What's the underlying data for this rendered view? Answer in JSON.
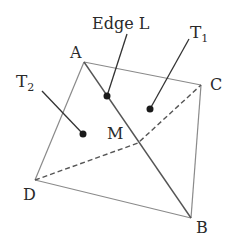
{
  "diagram": {
    "vertices": {
      "A": {
        "label": "A",
        "x": 84,
        "y": 62
      },
      "B": {
        "label": "B",
        "x": 191,
        "y": 218
      },
      "C": {
        "label": "C",
        "x": 201,
        "y": 85
      },
      "D": {
        "label": "D",
        "x": 35,
        "y": 180
      },
      "M": {
        "label": "M",
        "x": 138,
        "y": 143
      }
    },
    "annotations": {
      "edge_l": {
        "label": "Edge L"
      },
      "t1": {
        "label": "T",
        "sub": "1"
      },
      "t2": {
        "label": "T",
        "sub": "2"
      }
    },
    "colors": {
      "edge": "#8a8a8a",
      "diag": "#555555",
      "dashed": "#555555",
      "dot": "#1a1a1a"
    }
  }
}
